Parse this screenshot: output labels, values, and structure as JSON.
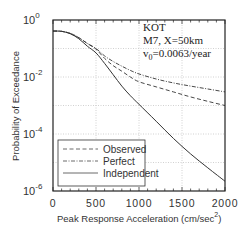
{
  "chart_data": {
    "type": "line",
    "title": "",
    "xlabel": "Peak Response Acceleration (cm/sec²)",
    "xlabel_main": "Peak Response Acceleration (cm/sec",
    "xlabel_sup": "2",
    "xlabel_close": ")",
    "ylabel": "Probability of Exceedance",
    "xlim": [
      0,
      2000
    ],
    "ylim": [
      1e-06,
      1
    ],
    "yscale": "log",
    "grid": true,
    "x_ticks": [
      "0",
      "500",
      "1000",
      "1500",
      "2000"
    ],
    "y_ticks": [
      {
        "base": "10",
        "exp": "0"
      },
      {
        "base": "10",
        "exp": "-2"
      },
      {
        "base": "10",
        "exp": "-4"
      },
      {
        "base": "10",
        "exp": "-6"
      }
    ],
    "annotation": {
      "line1": "KOT",
      "line2": "M7, X=50km",
      "line3_prefix": "v",
      "line3_sub": "0",
      "line3_rest": "=0.0063/year"
    },
    "legend_position": "lower left",
    "x": [
      0,
      100,
      200,
      300,
      400,
      500,
      600,
      700,
      800,
      900,
      1000,
      1200,
      1400,
      1600,
      1800,
      2000
    ],
    "series": [
      {
        "name": "Observed",
        "style": "dashed",
        "values": [
          0.41,
          0.4,
          0.34,
          0.24,
          0.15,
          0.095,
          0.045,
          0.025,
          0.016,
          0.01,
          0.0068,
          0.0045,
          0.003,
          0.002,
          0.0014,
          0.001
        ]
      },
      {
        "name": "Perfect",
        "style": "dash-dot",
        "values": [
          0.41,
          0.4,
          0.34,
          0.24,
          0.15,
          0.1,
          0.055,
          0.035,
          0.024,
          0.017,
          0.0128,
          0.0085,
          0.0062,
          0.0048,
          0.0038,
          0.003
        ]
      },
      {
        "name": "Independent",
        "style": "solid",
        "values": [
          0.41,
          0.4,
          0.33,
          0.22,
          0.12,
          0.07,
          0.03,
          0.012,
          0.0048,
          0.0022,
          0.0011,
          0.00028,
          7e-05,
          2e-05,
          6.5e-06,
          2.2e-06
        ]
      }
    ]
  }
}
